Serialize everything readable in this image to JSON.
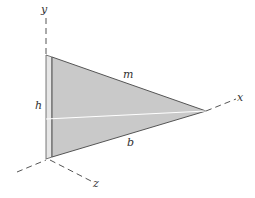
{
  "diagram": {
    "axes": {
      "x": "x",
      "y": "y",
      "z": "z"
    },
    "dimensions": {
      "top_edge": "m",
      "height": "h",
      "base": "b"
    },
    "colors": {
      "plate_fill": "#c9c9c9",
      "plate_edge": "#e4e4e4",
      "outline": "#555555",
      "axis": "#555555",
      "centerline": "#ffffff"
    }
  }
}
